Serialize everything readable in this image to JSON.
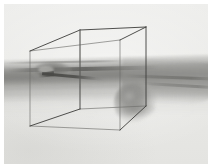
{
  "viewport": {
    "width": 212,
    "height": 168,
    "paper_color": "#ffffff",
    "background_color": "#e9e9e7",
    "alt": "Grayscale volume rendering of a human forearm and clenched hand with a perspective wireframe bounding box"
  },
  "render": {
    "title": "3D volume render viewport",
    "mode": "grayscale volumetric",
    "subject": "forearm and hand",
    "overlay": "wireframe bounding box",
    "background_color": "#e9e9e7",
    "volume_color": "#8d8d8a",
    "wire_color": "#3c3c3a",
    "hidden_wire_color": "#6c6c69",
    "axis_tick_color": "#8a8a87"
  },
  "volume": {
    "layers": [
      {
        "name": "arm-shaft",
        "label": "forearm shaft"
      },
      {
        "name": "arm-shaft-core",
        "label": "forearm dense core"
      },
      {
        "name": "arm-distal",
        "label": "distal forearm"
      },
      {
        "name": "hand-mass",
        "label": "clenched hand"
      },
      {
        "name": "hand-knuckle",
        "label": "knuckle highlight"
      },
      {
        "name": "wrist-cuff",
        "label": "wrist cuff"
      },
      {
        "name": "needle",
        "label": "probe sliver"
      },
      {
        "name": "ground-shade",
        "label": "ground shadow"
      }
    ]
  },
  "wireframe": {
    "shape": "cube",
    "projection": "perspective",
    "stroke_width": 0.9,
    "vertices": {
      "front_top_left": [
        26,
        47
      ],
      "front_top_right": [
        116,
        36
      ],
      "front_bottom_left": [
        26,
        122
      ],
      "front_bottom_right": [
        116,
        126
      ],
      "back_top_left": [
        76,
        26
      ],
      "back_top_right": [
        142,
        23
      ],
      "back_bottom_left": [
        76,
        105
      ],
      "back_bottom_right": [
        142,
        102
      ]
    },
    "edges": [
      "front_top_left-front_top_right",
      "front_top_right-front_bottom_right",
      "front_bottom_right-front_bottom_left",
      "front_bottom_left-front_top_left",
      "back_top_left-back_top_right",
      "back_top_right-back_bottom_right",
      "back_bottom_right-back_bottom_left",
      "back_bottom_left-back_top_left",
      "front_top_left-back_top_left",
      "front_top_right-back_top_right",
      "front_bottom_left-back_bottom_left",
      "front_bottom_right-back_bottom_right"
    ],
    "axis_marker": {
      "from": [
        76,
        26
      ],
      "to": [
        76,
        80
      ],
      "label": "vertical axis tick"
    }
  }
}
